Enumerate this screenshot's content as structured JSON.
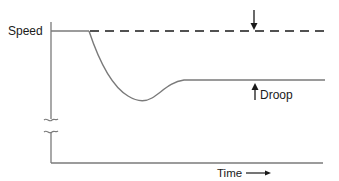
{
  "diagram": {
    "y_axis_label": "Speed",
    "x_axis_label": "Time",
    "x_axis_arrow": "right-arrow",
    "annotation": "Droop",
    "colors": {
      "axis": "#7a7a7a",
      "curve": "#7a7a7a",
      "reference_line": "#1a1a1a",
      "arrow": "#1a1a1a",
      "text": "#1a1a1a"
    },
    "elements": {
      "y_axis": "vertical axis with break marks",
      "x_axis": "horizontal time axis",
      "reference_line": "dashed no-load speed reference",
      "response_curve": "speed dips after load step then settles below reference",
      "droop_indicator": "opposing arrows marking gap between reference and settled speed"
    }
  }
}
